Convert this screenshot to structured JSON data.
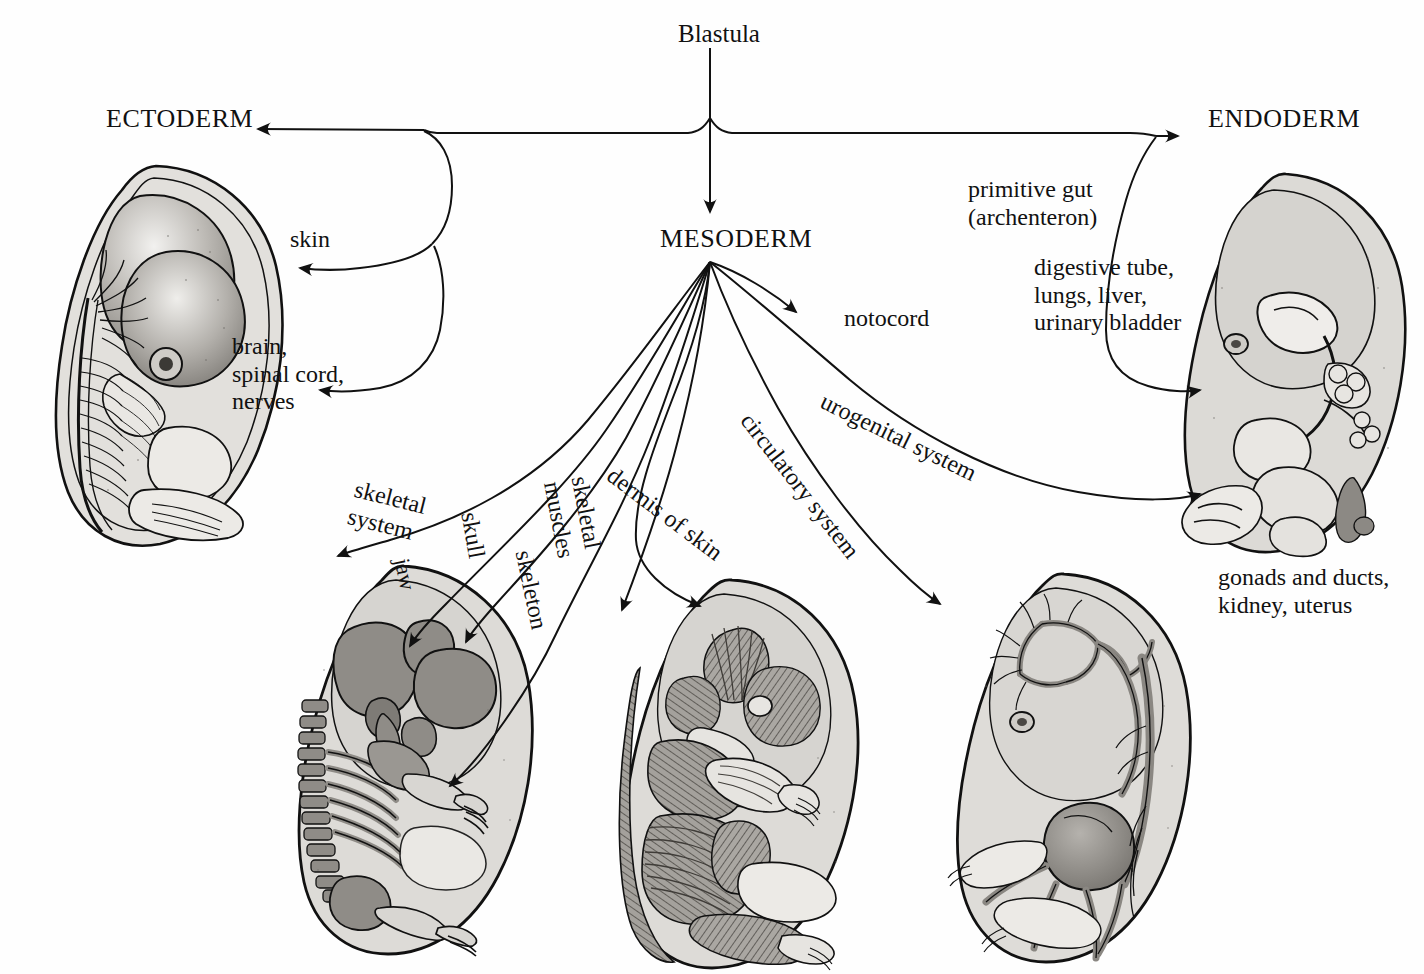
{
  "diagram": {
    "title": "Blastula",
    "germ_layers": {
      "ectoderm": "ECTODERM",
      "mesoderm": "MESODERM",
      "endoderm": "ENDODERM"
    },
    "ectoderm_labels": [
      {
        "id": "skin",
        "text": "skin"
      },
      {
        "id": "neural",
        "text": "brain,\nspinal cord,\nnerves"
      }
    ],
    "endoderm_labels": [
      {
        "id": "primitive-gut",
        "text": "primitive gut\n(archenteron)"
      },
      {
        "id": "digestive",
        "text": "digestive tube,\nlungs, liver,\nurinary bladder"
      }
    ],
    "mesoderm_labels": [
      {
        "id": "notocord",
        "text": "notocord"
      },
      {
        "id": "skeletal-system",
        "text": "skeletal\nsystem"
      },
      {
        "id": "jaw",
        "text": "jaw"
      },
      {
        "id": "skull",
        "text": "skull"
      },
      {
        "id": "skeleton",
        "text": "skeleton"
      },
      {
        "id": "skeletal-muscles",
        "text": "skeletal\nmuscles"
      },
      {
        "id": "dermis-of-skin",
        "text": "dermis of skin"
      },
      {
        "id": "circulatory-system",
        "text": "circulatory system"
      },
      {
        "id": "urogenital-system",
        "text": "urogenital system"
      }
    ],
    "captions": [
      {
        "id": "gonads",
        "text": "gonads and ducts,\nkidney, uterus"
      }
    ],
    "embryos": [
      {
        "id": "nervous",
        "name": "ectoderm-embryo-nervous-system"
      },
      {
        "id": "digestive",
        "name": "endoderm-embryo-digestive-system"
      },
      {
        "id": "skeletal",
        "name": "mesoderm-embryo-skeletal-system"
      },
      {
        "id": "muscular",
        "name": "mesoderm-embryo-muscular-system"
      },
      {
        "id": "circulatory",
        "name": "mesoderm-embryo-circulatory-system"
      }
    ],
    "colors": {
      "ink": "#111111",
      "body_fill": "#d8d6d2",
      "organ_fill": "#9a9792",
      "organ_dark": "#6f6c68",
      "background": "#ffffff"
    }
  }
}
